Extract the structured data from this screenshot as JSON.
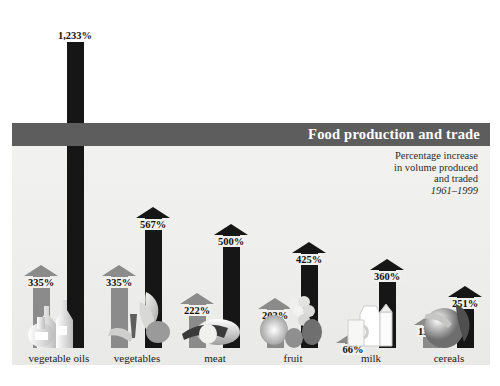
{
  "header": {
    "title": "Food production and trade",
    "subtitle_lines": [
      "Percentage increase",
      "in volume produced",
      "and traded"
    ],
    "years": "1961–1999",
    "band_color": "#5d5d5d",
    "panel_color": "#efefed"
  },
  "legend": {
    "production_color": "#8b8b8b",
    "trade_color": "#161616"
  },
  "chart_data": {
    "type": "bar",
    "title": "Food production and trade",
    "subtitle": "Percentage increase in volume produced and traded 1961–1999",
    "xlabel": "",
    "ylabel": "Percentage increase",
    "ylim": [
      0,
      1233
    ],
    "grid": false,
    "legend_position": "none",
    "categories": [
      "vegetable oils",
      "vegetables",
      "meat",
      "fruit",
      "milk",
      "cereals"
    ],
    "series": [
      {
        "name": "volume produced",
        "color": "#8b8b8b",
        "values": [
          335,
          335,
          222,
          203,
          66,
          137
        ],
        "labels": [
          "335%",
          "335%",
          "222%",
          "203%",
          "66%",
          "137%"
        ]
      },
      {
        "name": "volume traded",
        "color": "#161616",
        "values": [
          1233,
          567,
          500,
          425,
          360,
          251
        ],
        "labels": [
          "1,233%",
          "567%",
          "500%",
          "425%",
          "360%",
          "251%"
        ]
      }
    ]
  },
  "groups": [
    {
      "id": "vegetable-oils",
      "label": "vegetable oils",
      "produced": {
        "value": 335,
        "label": "335%"
      },
      "traded": {
        "value": 1233,
        "label": "1,233%",
        "clipped": true
      }
    },
    {
      "id": "vegetables",
      "label": "vegetables",
      "produced": {
        "value": 335,
        "label": "335%"
      },
      "traded": {
        "value": 567,
        "label": "567%",
        "clipped": false
      }
    },
    {
      "id": "meat",
      "label": "meat",
      "produced": {
        "value": 222,
        "label": "222%"
      },
      "traded": {
        "value": 500,
        "label": "500%",
        "clipped": false
      }
    },
    {
      "id": "fruit",
      "label": "fruit",
      "produced": {
        "value": 203,
        "label": "203%"
      },
      "traded": {
        "value": 425,
        "label": "425%",
        "clipped": false
      }
    },
    {
      "id": "milk",
      "label": "milk",
      "produced": {
        "value": 66,
        "label": "66%"
      },
      "traded": {
        "value": 360,
        "label": "360%",
        "clipped": false
      }
    },
    {
      "id": "cereals",
      "label": "cereals",
      "produced": {
        "value": 137,
        "label": "137%"
      },
      "traded": {
        "value": 251,
        "label": "251%",
        "clipped": false
      }
    }
  ]
}
